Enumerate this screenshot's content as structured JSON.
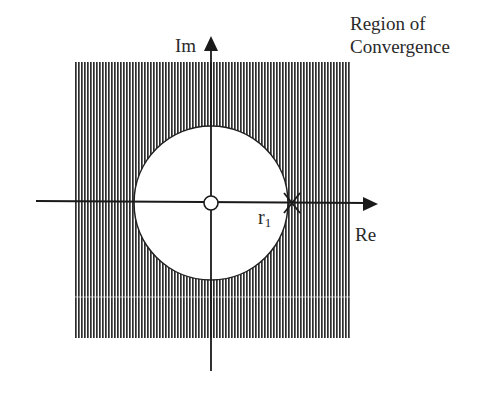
{
  "diagram": {
    "type": "z-plane region of convergence",
    "title_lines": [
      "Region of",
      "Convergence"
    ],
    "axes": {
      "real_label": "Re",
      "imag_label": "Im"
    },
    "pole_label": {
      "base": "r",
      "subscript": "1"
    },
    "elements": {
      "shaded_region": {
        "description": "vertical hatching outside circle of radius r1",
        "color": "#3a3a3a"
      },
      "circle": {
        "description": "boundary |z| = r1",
        "stroke": "#222222"
      },
      "origin_marker": "zero (open circle) at origin",
      "pole_marker": "pole (x) at z = r1 on the real axis"
    }
  }
}
